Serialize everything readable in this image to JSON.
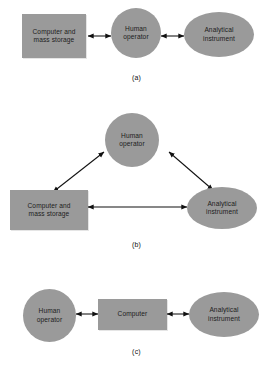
{
  "figure": {
    "background_color": "#ffffff",
    "shape_fill_color": "#9a9a9a",
    "line_color": "#111111",
    "text_color": "#1c1c1c"
  },
  "panels": [
    {
      "id": "a",
      "caption": "(a)",
      "nodes": [
        {
          "name": "computer-and-mass-storage",
          "label": "Computer and\nmass storage",
          "shape": "rect"
        },
        {
          "name": "human-operator",
          "label": "Human\noperator",
          "shape": "circle"
        },
        {
          "name": "analytical-instrument",
          "label": "Analytical\ninstrument",
          "shape": "ellipse"
        }
      ],
      "connections": [
        {
          "from": "computer-and-mass-storage",
          "to": "human-operator",
          "style": "double-arrow"
        },
        {
          "from": "human-operator",
          "to": "analytical-instrument",
          "style": "double-arrow"
        }
      ]
    },
    {
      "id": "b",
      "caption": "(b)",
      "nodes": [
        {
          "name": "human-operator",
          "label": "Human\noperator",
          "shape": "circle"
        },
        {
          "name": "computer-and-mass-storage",
          "label": "Computer and\nmass storage",
          "shape": "rect"
        },
        {
          "name": "analytical-instrument",
          "label": "Analytical\ninstrument",
          "shape": "ellipse"
        }
      ],
      "connections": [
        {
          "from": "computer-and-mass-storage",
          "to": "human-operator",
          "style": "double-arrow"
        },
        {
          "from": "human-operator",
          "to": "analytical-instrument",
          "style": "double-arrow"
        },
        {
          "from": "computer-and-mass-storage",
          "to": "analytical-instrument",
          "style": "double-arrow"
        }
      ]
    },
    {
      "id": "c",
      "caption": "(c)",
      "nodes": [
        {
          "name": "human-operator",
          "label": "Human\noperator",
          "shape": "circle"
        },
        {
          "name": "computer",
          "label": "Computer",
          "shape": "rect"
        },
        {
          "name": "analytical-instrument",
          "label": "Analytical\ninstrument",
          "shape": "ellipse"
        }
      ],
      "connections": [
        {
          "from": "human-operator",
          "to": "computer",
          "style": "double-arrow"
        },
        {
          "from": "computer",
          "to": "analytical-instrument",
          "style": "double-arrow"
        }
      ]
    }
  ]
}
